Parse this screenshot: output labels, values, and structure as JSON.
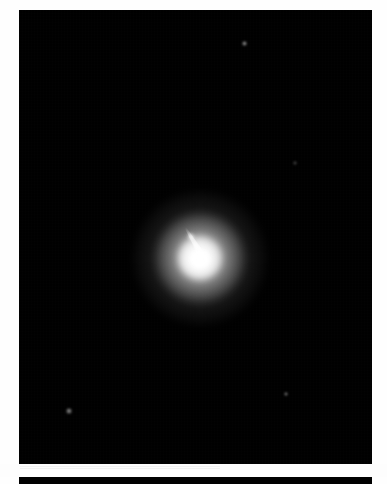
{
  "page": {
    "width": 387,
    "height": 484,
    "background_color": "#ffffff"
  },
  "plate": {
    "name": "astronomy-image",
    "background_color": "#000000",
    "bounds": {
      "x": 19,
      "y": 10,
      "width": 353,
      "height": 454
    },
    "caption": "",
    "object": {
      "type": "elliptical-galaxy-with-jet",
      "core_color": "#ffffff",
      "core_position": {
        "x": 200,
        "y": 258
      },
      "halo_diameter_px": 132,
      "jet": {
        "name": "relativistic-jet",
        "direction": "upper-left",
        "angle_deg": -121,
        "length_px": 28,
        "origin": {
          "x": 200,
          "y": 252
        },
        "tip": {
          "x": 186,
          "y": 230
        }
      }
    },
    "field_stars": [
      {
        "label": "star-1",
        "x": 244,
        "y": 43,
        "size": 5.0,
        "brightness": 0.62
      },
      {
        "label": "star-2",
        "x": 295,
        "y": 163,
        "size": 3.4,
        "brightness": 0.3
      },
      {
        "label": "star-3",
        "x": 69,
        "y": 411,
        "size": 5.2,
        "brightness": 0.58
      },
      {
        "label": "star-4",
        "x": 286,
        "y": 394,
        "size": 4.6,
        "brightness": 0.52
      }
    ]
  },
  "gutter": {
    "name": "page-gutter",
    "background_color": "#fdfdfd",
    "bounds": {
      "x": 0,
      "y": 464,
      "width": 387,
      "height": 13
    }
  },
  "next_plate": {
    "name": "next-image-top-edge",
    "background_color": "#000000",
    "bounds": {
      "x": 19,
      "y": 477,
      "width": 353,
      "height": 7
    }
  }
}
